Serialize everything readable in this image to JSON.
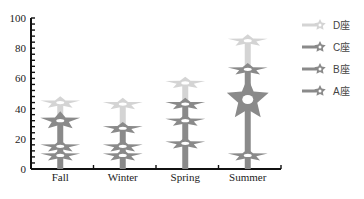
{
  "chart_data": {
    "type": "line",
    "subtype": "stacked star-marker columns",
    "title": "",
    "xlabel": "",
    "ylabel": "",
    "categories": [
      "Fall",
      "Winter",
      "Spring",
      "Summer"
    ],
    "ylim": [
      0,
      100
    ],
    "yticks": [
      0,
      20,
      40,
      60,
      80,
      100
    ],
    "grid": false,
    "legend_position": "right",
    "series": [
      {
        "name": "D座",
        "color": "#d4d4d4",
        "values": [
          44,
          43,
          57,
          85
        ]
      },
      {
        "name": "C座",
        "color": "#8a8a8a",
        "values": [
          32,
          27,
          43,
          66
        ]
      },
      {
        "name": "B座",
        "color": "#8a8a8a",
        "values": [
          15,
          15,
          32,
          46
        ]
      },
      {
        "name": "A座",
        "color": "#8a8a8a",
        "values": [
          9,
          9,
          17,
          9
        ]
      }
    ]
  },
  "legend": {
    "items": [
      {
        "label": "D座",
        "color": "#d4d4d4"
      },
      {
        "label": "C座",
        "color": "#8a8a8a"
      },
      {
        "label": "B座",
        "color": "#8a8a8a"
      },
      {
        "label": "A座",
        "color": "#8a8a8a"
      }
    ]
  }
}
